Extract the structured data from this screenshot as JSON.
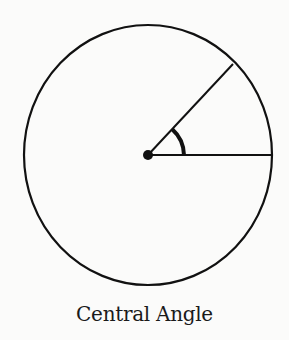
{
  "diagram": {
    "caption": "Central Angle",
    "colors": {
      "stroke": "#111111",
      "background": "#fbfbfa"
    },
    "circle": {
      "cx": 148,
      "cy": 155,
      "rx": 124,
      "ry": 130
    },
    "center_point": {
      "x": 148,
      "y": 155,
      "r": 5
    },
    "radii": [
      {
        "name": "horizontal-radius",
        "x2": 272,
        "y2": 155
      },
      {
        "name": "diagonal-radius",
        "x2": 233,
        "y2": 64
      }
    ],
    "angle_marker": {
      "name": "central-angle-arc"
    }
  }
}
